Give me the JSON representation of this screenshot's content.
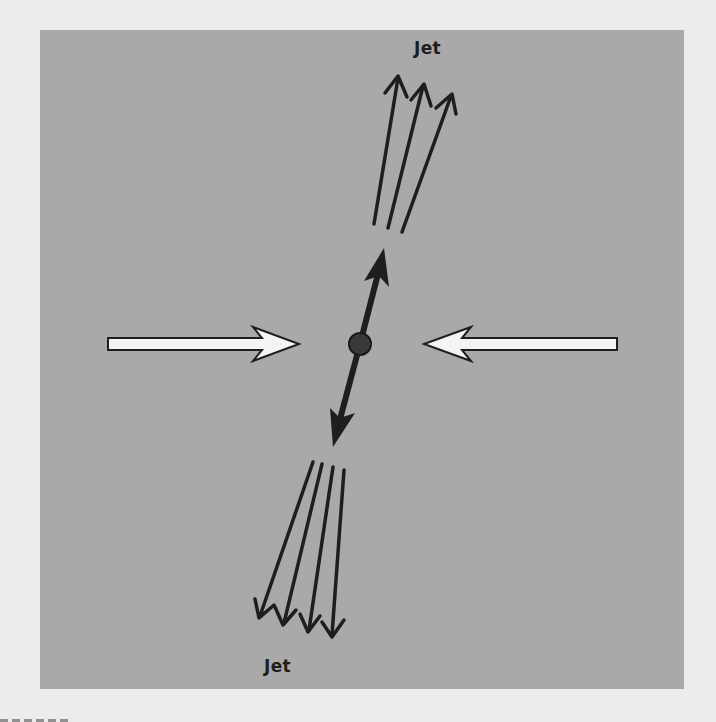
{
  "figure": {
    "labels": {
      "top_jet": "Jet",
      "bottom_jet": "Jet"
    },
    "colors": {
      "page_background": "#ececec",
      "panel_background": "#a9a9a9",
      "ink": "#1e1e1e",
      "beam_fill": "#f4f4f4",
      "collision_point": "#3a3a3a"
    },
    "elements": {
      "incoming_beams": [
        {
          "id": "left-beam",
          "direction": "right",
          "tail": [
            108,
            344
          ],
          "tip": [
            299,
            344
          ]
        },
        {
          "id": "right-beam",
          "direction": "left",
          "tail": [
            617,
            344
          ],
          "tip": [
            424,
            344
          ]
        }
      ],
      "collision_point": {
        "center": [
          360,
          344
        ],
        "radius": 11
      },
      "primary_products": [
        {
          "id": "up-product",
          "tip": [
            384,
            248
          ]
        },
        {
          "id": "down-product",
          "tip": [
            333,
            447
          ]
        }
      ],
      "top_jet_tracks": [
        {
          "from": [
            374,
            224
          ],
          "to": [
            398,
            76
          ]
        },
        {
          "from": [
            388,
            228
          ],
          "to": [
            424,
            84
          ]
        },
        {
          "from": [
            402,
            232
          ],
          "to": [
            452,
            94
          ]
        }
      ],
      "bottom_jet_tracks": [
        {
          "from": [
            313,
            462
          ],
          "to": [
            259,
            618
          ]
        },
        {
          "from": [
            322,
            464
          ],
          "to": [
            283,
            625
          ]
        },
        {
          "from": [
            333,
            467
          ],
          "to": [
            308,
            632
          ]
        },
        {
          "from": [
            344,
            470
          ],
          "to": [
            332,
            637
          ]
        }
      ]
    }
  }
}
